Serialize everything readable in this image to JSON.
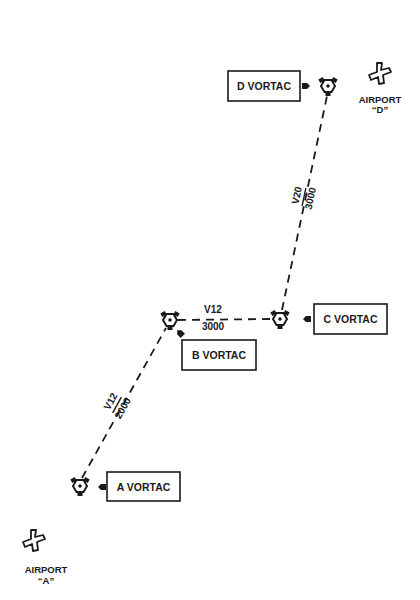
{
  "diagram": {
    "type": "VOR airway route diagram",
    "colors": {
      "ink": "#1a1a1a",
      "background": "#ffffff"
    },
    "vortacs": [
      {
        "id": "A",
        "label": "A VORTAC"
      },
      {
        "id": "B",
        "label": "B VORTAC"
      },
      {
        "id": "C",
        "label": "C VORTAC"
      },
      {
        "id": "D",
        "label": "D VORTAC"
      }
    ],
    "airways": [
      {
        "from": "A",
        "to": "B",
        "name": "V12",
        "altitude": "2000"
      },
      {
        "from": "B",
        "to": "C",
        "name": "V12",
        "altitude": "3000"
      },
      {
        "from": "C",
        "to": "D",
        "name": "V20",
        "altitude": "3000"
      }
    ],
    "airports": [
      {
        "id": "A",
        "label": "AIRPORT",
        "sublabel": "“A”"
      },
      {
        "id": "D",
        "label": "AIRPORT",
        "sublabel": "“D”"
      }
    ]
  }
}
